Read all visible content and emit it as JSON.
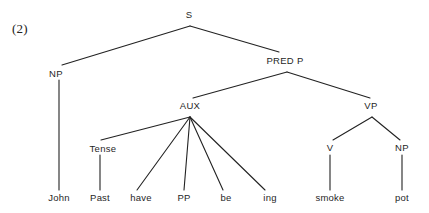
{
  "figure": {
    "example_number": "(2)",
    "type": "syntax-tree",
    "sentence": "John Past have PP be ing smoke pot",
    "line_color": "#222222",
    "background_color": "#ffffff",
    "text_color": "#1f1f1f"
  },
  "nodes": [
    {
      "id": "s",
      "label": "S",
      "x": 189,
      "y": 14,
      "kind": "nonterminal"
    },
    {
      "id": "np1",
      "label": "NP",
      "x": 56,
      "y": 73,
      "kind": "nonterminal"
    },
    {
      "id": "predp",
      "label": "PRED P",
      "x": 285,
      "y": 60,
      "kind": "nonterminal"
    },
    {
      "id": "aux",
      "label": "AUX",
      "x": 190,
      "y": 105,
      "kind": "nonterminal"
    },
    {
      "id": "vp",
      "label": "VP",
      "x": 371,
      "y": 105,
      "kind": "nonterminal"
    },
    {
      "id": "tense",
      "label": "Tense",
      "x": 103,
      "y": 148,
      "kind": "nonterminal"
    },
    {
      "id": "v",
      "label": "V",
      "x": 330,
      "y": 147,
      "kind": "nonterminal"
    },
    {
      "id": "np2",
      "label": "NP",
      "x": 402,
      "y": 147,
      "kind": "nonterminal"
    }
  ],
  "leaves": [
    {
      "id": "john",
      "label": "John",
      "x": 59,
      "y": 197
    },
    {
      "id": "past",
      "label": "Past",
      "x": 100,
      "y": 197
    },
    {
      "id": "have",
      "label": "have",
      "x": 141,
      "y": 197
    },
    {
      "id": "pp",
      "label": "PP",
      "x": 184,
      "y": 197
    },
    {
      "id": "be",
      "label": "be",
      "x": 226,
      "y": 197
    },
    {
      "id": "ing",
      "label": "ing",
      "x": 270,
      "y": 197
    },
    {
      "id": "smoke",
      "label": "smoke",
      "x": 330,
      "y": 197
    },
    {
      "id": "pot",
      "label": "pot",
      "x": 402,
      "y": 197
    }
  ],
  "edges": [
    {
      "from": "s",
      "to": "np1",
      "x1": 190,
      "y1": 26,
      "x2": 62,
      "y2": 65
    },
    {
      "from": "s",
      "to": "predp",
      "x1": 190,
      "y1": 26,
      "x2": 279,
      "y2": 52
    },
    {
      "from": "predp",
      "to": "aux",
      "x1": 287,
      "y1": 72,
      "x2": 193,
      "y2": 98
    },
    {
      "from": "predp",
      "to": "vp",
      "x1": 287,
      "y1": 72,
      "x2": 370,
      "y2": 98
    },
    {
      "from": "aux",
      "to": "tense",
      "x1": 190,
      "y1": 117,
      "x2": 101,
      "y2": 140
    },
    {
      "from": "aux",
      "to": "have",
      "x1": 190,
      "y1": 117,
      "x2": 137,
      "y2": 190
    },
    {
      "from": "aux",
      "to": "pp",
      "x1": 190,
      "y1": 117,
      "x2": 184,
      "y2": 190
    },
    {
      "from": "aux",
      "to": "be",
      "x1": 190,
      "y1": 117,
      "x2": 223,
      "y2": 190
    },
    {
      "from": "aux",
      "to": "ing",
      "x1": 190,
      "y1": 117,
      "x2": 265,
      "y2": 190
    },
    {
      "from": "np1",
      "to": "john",
      "x1": 59,
      "y1": 80,
      "x2": 59,
      "y2": 190
    },
    {
      "from": "tense",
      "to": "past",
      "x1": 100,
      "y1": 155,
      "x2": 100,
      "y2": 190
    },
    {
      "from": "vp",
      "to": "v",
      "x1": 372,
      "y1": 117,
      "x2": 333,
      "y2": 140
    },
    {
      "from": "vp",
      "to": "np2",
      "x1": 372,
      "y1": 117,
      "x2": 400,
      "y2": 140
    },
    {
      "from": "v",
      "to": "smoke",
      "x1": 330,
      "y1": 155,
      "x2": 330,
      "y2": 190
    },
    {
      "from": "np2",
      "to": "pot",
      "x1": 402,
      "y1": 155,
      "x2": 402,
      "y2": 190
    }
  ]
}
